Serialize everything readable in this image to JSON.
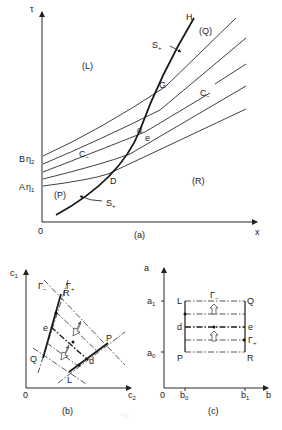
{
  "figure": {
    "caption": "Fig."
  },
  "panel_a": {
    "label": "(a)",
    "axes": {
      "y_label": "τ",
      "x_label": "x",
      "origin": "0"
    },
    "y_ticks": [
      {
        "letter": "B",
        "symbol": "η",
        "sub": "2"
      },
      {
        "letter": "A",
        "symbol": "η",
        "sub": "1"
      }
    ],
    "regions": [
      "(L)",
      "(Q)",
      "(P)",
      "(R)"
    ],
    "curve_labels": {
      "shock_upper": "S",
      "shock_upper_sup": "+",
      "shock_lower": "S",
      "shock_lower_sup": "+",
      "char_1": "C",
      "char_1_sub": "−",
      "char_2": "C",
      "char_2_sub": "−"
    },
    "points": [
      "H",
      "G",
      "d",
      "e",
      "D"
    ]
  },
  "panel_b": {
    "label": "(b)",
    "axes": {
      "y_label": "c",
      "y_sub": "1",
      "x_label": "c",
      "x_sub": "2",
      "origin": "0"
    },
    "gamma_minus": "Γ",
    "gamma_minus_sub": "−",
    "gamma_plus": "Γ",
    "gamma_plus_sub": "+",
    "points": [
      "R",
      "e",
      "Q",
      "P",
      "d",
      "L"
    ]
  },
  "panel_c": {
    "label": "(c)",
    "axes": {
      "y_label": "a",
      "x_label": "b",
      "origin": "0"
    },
    "y_ticks": [
      {
        "t": "a",
        "sub": "1"
      },
      {
        "t": "a",
        "sub": "0"
      }
    ],
    "x_ticks": [
      {
        "t": "b",
        "sub": "0"
      },
      {
        "t": "b",
        "sub": "1"
      }
    ],
    "gamma_minus": "Γ",
    "gamma_minus_sub": "−",
    "gamma_plus": "Γ",
    "gamma_plus_sub": "+",
    "points": [
      "L",
      "Q",
      "d",
      "e",
      "P",
      "R"
    ]
  }
}
